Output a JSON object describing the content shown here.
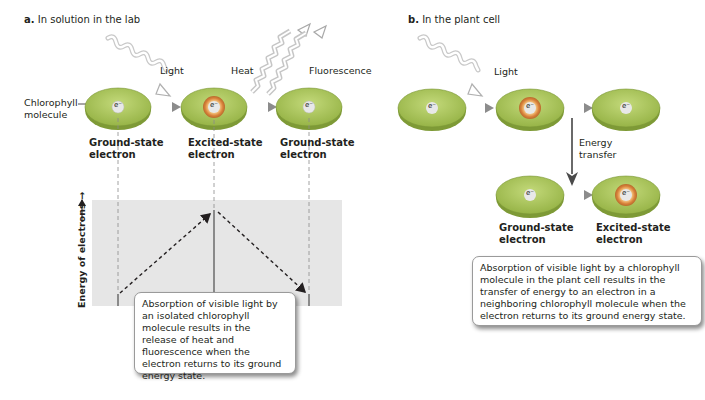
{
  "panel_a": {
    "letter": "a.",
    "title": "In solution in the lab",
    "labels": {
      "light": "Light",
      "heat": "Heat",
      "fluorescence": "Fluorescence",
      "chlorophyll_line1": "Chlorophyll",
      "chlorophyll_line2": "molecule"
    },
    "molecules": [
      {
        "state": "ground",
        "electron": "e⁻",
        "label_line1": "Ground-state",
        "label_line2": "electron"
      },
      {
        "state": "excited",
        "electron": "e⁻",
        "label_line1": "Excited-state",
        "label_line2": "electron"
      },
      {
        "state": "ground",
        "electron": "e⁻",
        "label_line1": "Ground-state",
        "label_line2": "electron"
      }
    ],
    "energy_axis_label": "Energy of electrons →",
    "caption": "Absorption of visible light by an isolated chlorophyll molecule results in the release of heat and fluorescence when the electron returns to its ground energy state."
  },
  "panel_b": {
    "letter": "b.",
    "title": "In the plant cell",
    "labels": {
      "light": "Light",
      "energy_line1": "Energy",
      "energy_line2": "transfer"
    },
    "top_row": [
      {
        "state": "ground",
        "electron": "e⁻"
      },
      {
        "state": "excited",
        "electron": "e⁻"
      },
      {
        "state": "ground",
        "electron": "e⁻"
      }
    ],
    "bottom_row": [
      {
        "state": "ground",
        "electron": "e⁻",
        "label_line1": "Ground-state",
        "label_line2": "electron"
      },
      {
        "state": "excited",
        "electron": "e⁻",
        "label_line1": "Excited-state",
        "label_line2": "electron"
      }
    ],
    "caption": "Absorption of visible light by a chlorophyll molecule in the plant cell results in the transfer of energy to an electron in a neighboring chlorophyll molecule when the electron returns to its ground energy state."
  },
  "colors": {
    "molecule_fill": "#a9c45a",
    "molecule_edge": "#6e8a2e",
    "electron_fill": "#e6e6e6",
    "excited_ring": "#d9823b",
    "arrow_gray": "#8c8c8c",
    "chart_bg": "#e6e6e6"
  }
}
